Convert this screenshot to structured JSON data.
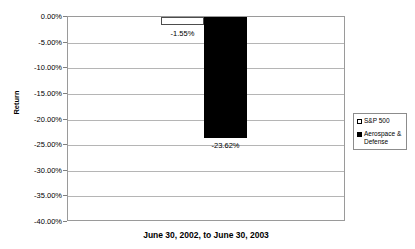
{
  "chart_data": {
    "type": "bar",
    "title": "",
    "xlabel": "June 30, 2002, to June 30, 2003",
    "ylabel": "Return",
    "categories": [
      "June 30, 2002, to June 30, 2003"
    ],
    "series": [
      {
        "name": "S&P 500",
        "values": [
          -1.55
        ],
        "label": "-1.55%",
        "color": "#ffffff",
        "marker": "hollow-square"
      },
      {
        "name": "Aerospace & Defense",
        "values": [
          -23.62
        ],
        "label": "-23.62%",
        "color": "#000000",
        "marker": "solid-square"
      }
    ],
    "ylim": [
      -40.0,
      0.0
    ],
    "y_tick_labels": [
      "0.00%",
      "-5.00%",
      "-10.00%",
      "-15.00%",
      "-20.00%",
      "-25.00%",
      "-30.00%",
      "-35.00%",
      "-40.00%"
    ],
    "y_tick_values": [
      0,
      -5,
      -10,
      -15,
      -20,
      -25,
      -30,
      -35,
      -40
    ],
    "grid": true,
    "legend_position": "right",
    "data_labels": [
      "-1.55%",
      "-23.62%"
    ]
  },
  "legend": {
    "entries": [
      {
        "label": "S&P 500"
      },
      {
        "label": "Aerospace & Defense"
      }
    ]
  },
  "axes": {
    "y_title": "Return",
    "x_title": "June 30, 2002, to June 30, 2003"
  }
}
